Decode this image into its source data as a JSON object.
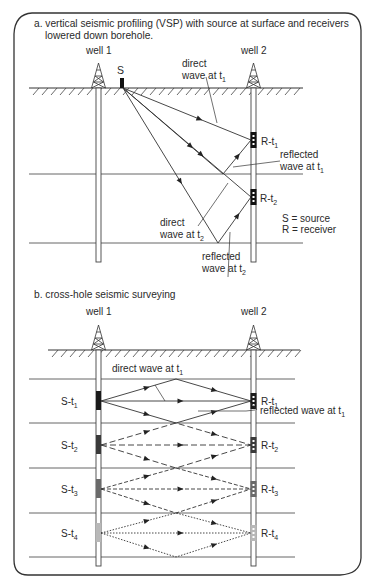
{
  "panel_a": {
    "title_line1": "a. vertical seismic profiling (VSP) with source at surface and receivers",
    "title_line2": "lowered down borehole.",
    "well1_label": "well 1",
    "well2_label": "well 2",
    "source_label": "S",
    "receiver1": {
      "base": "R-t",
      "sub": "1"
    },
    "receiver2": {
      "base": "R-t",
      "sub": "2"
    },
    "direct_t1": {
      "line1": "direct",
      "line2_base": "wave at t",
      "sub": "1"
    },
    "reflected_t1": {
      "line1": "reflected",
      "line2_base": "wave at t",
      "sub": "1"
    },
    "direct_t2": {
      "line1": "direct",
      "line2_base": "wave at t",
      "sub": "2"
    },
    "reflected_t2": {
      "line1": "reflected",
      "line2_base": "wave at t",
      "sub": "2"
    },
    "legend": {
      "source": "S = source",
      "receiver": "R = receiver"
    }
  },
  "panel_b": {
    "title": "b. cross-hole seismic surveying",
    "well1_label": "well 1",
    "well2_label": "well 2",
    "direct_t1": {
      "base": "direct wave at t",
      "sub": "1"
    },
    "reflected_t1": {
      "base": "reflected wave at t",
      "sub": "1"
    },
    "sources": [
      {
        "base": "S-t",
        "sub": "1",
        "style": "solid",
        "shade": "#1a1a1a"
      },
      {
        "base": "S-t",
        "sub": "2",
        "style": "dashed",
        "shade": "#3a3a3a"
      },
      {
        "base": "S-t",
        "sub": "3",
        "style": "dash-dot",
        "shade": "#6a6a6a"
      },
      {
        "base": "S-t",
        "sub": "4",
        "style": "dotted",
        "shade": "#b8b8b8"
      }
    ],
    "receivers": [
      {
        "base": "R-t",
        "sub": "1"
      },
      {
        "base": "R-t",
        "sub": "2"
      },
      {
        "base": "R-t",
        "sub": "3"
      },
      {
        "base": "R-t",
        "sub": "4"
      }
    ]
  },
  "colors": {
    "ink": "#2a2a2a",
    "line": "#555555",
    "border": "#333333"
  }
}
